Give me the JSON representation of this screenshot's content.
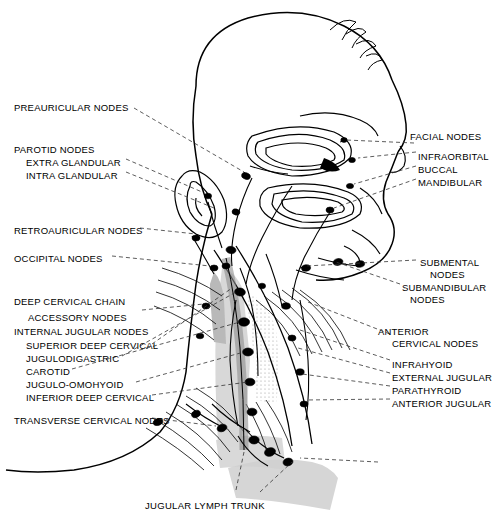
{
  "figure": {
    "title_caption": "JUGULAR LYMPH TRUNK",
    "colors": {
      "ink": "#000000",
      "background": "#ffffff",
      "node_fill": "#000000",
      "vessel_shade": "#c9c9c9",
      "tissue_shade": "#d9d9d9",
      "leader_line": "#555555"
    }
  },
  "labels_left": [
    {
      "id": "preauricular-nodes",
      "text": "PREAURICULAR NODES",
      "x": 14,
      "y": 103,
      "indent": 0
    },
    {
      "id": "parotid-nodes",
      "text": "PAROTID NODES",
      "x": 14,
      "y": 145,
      "indent": 0
    },
    {
      "id": "extra-glandular",
      "text": "EXTRA GLANDULAR",
      "x": 26,
      "y": 158,
      "indent": 12
    },
    {
      "id": "intra-glandular",
      "text": "INTRA GLANDULAR",
      "x": 26,
      "y": 171,
      "indent": 12
    },
    {
      "id": "retroauricular-nodes",
      "text": "RETROAURICULAR NODES",
      "x": 14,
      "y": 226,
      "indent": 0
    },
    {
      "id": "occipital-nodes",
      "text": "OCCIPITAL NODES",
      "x": 14,
      "y": 254,
      "indent": 0
    },
    {
      "id": "deep-cervical-chain",
      "text": "DEEP CERVICAL CHAIN",
      "x": 14,
      "y": 297,
      "indent": 0
    },
    {
      "id": "accessory-nodes",
      "text": "ACCESSORY  NODES",
      "x": 28,
      "y": 313,
      "indent": 14
    },
    {
      "id": "internal-jugular-nodes",
      "text": "INTERNAL JUGULAR NODES",
      "x": 14,
      "y": 327,
      "indent": 0
    },
    {
      "id": "superior-deep-cervical",
      "text": "SUPERIOR DEEP CERVICAL",
      "x": 26,
      "y": 341,
      "indent": 12
    },
    {
      "id": "jugulodigastric",
      "text": "JUGULODIGASTRIC",
      "x": 26,
      "y": 354,
      "indent": 12
    },
    {
      "id": "carotid",
      "text": "CAROTID",
      "x": 26,
      "y": 367,
      "indent": 12
    },
    {
      "id": "jugulo-omohyoid",
      "text": "JUGULO-OMOHYOID",
      "x": 26,
      "y": 380,
      "indent": 12
    },
    {
      "id": "inferior-deep-cervical",
      "text": "INFERIOR DEEP CERVICAL",
      "x": 26,
      "y": 393,
      "indent": 12
    },
    {
      "id": "transverse-cervical-nodes",
      "text": "TRANSVERSE CERVICAL NODES",
      "x": 14,
      "y": 416,
      "indent": 0
    }
  ],
  "labels_right": [
    {
      "id": "facial-nodes",
      "text": "FACIAL NODES",
      "x": 410,
      "y": 132,
      "indent": 0
    },
    {
      "id": "infraorbital",
      "text": "INFRAORBITAL",
      "x": 418,
      "y": 152,
      "indent": 8
    },
    {
      "id": "buccal",
      "text": "BUCCAL",
      "x": 418,
      "y": 165,
      "indent": 8
    },
    {
      "id": "mandibular",
      "text": "MANDIBULAR",
      "x": 418,
      "y": 178,
      "indent": 8
    },
    {
      "id": "submental-nodes",
      "text": "SUBMENTAL",
      "x": 420,
      "y": 258,
      "indent": 0
    },
    {
      "id": "submental-nodes-2",
      "text": "NODES",
      "x": 430,
      "y": 270,
      "indent": 0
    },
    {
      "id": "submandibular-nodes",
      "text": "SUBMANDIBULAR",
      "x": 402,
      "y": 283,
      "indent": 0
    },
    {
      "id": "submandibular-nodes-2",
      "text": "NODES",
      "x": 410,
      "y": 295,
      "indent": 0
    },
    {
      "id": "anterior-cervical-nodes",
      "text": "ANTERIOR",
      "x": 378,
      "y": 327,
      "indent": 0
    },
    {
      "id": "anterior-cervical-nodes-2",
      "text": "CERVICAL NODES",
      "x": 392,
      "y": 339,
      "indent": 0
    },
    {
      "id": "infrahyoid",
      "text": "INFRAHYOID",
      "x": 392,
      "y": 360,
      "indent": 0
    },
    {
      "id": "external-jugular",
      "text": "EXTERNAL JUGULAR",
      "x": 392,
      "y": 373,
      "indent": 0
    },
    {
      "id": "parathyroid",
      "text": "PARATHYROID",
      "x": 392,
      "y": 386,
      "indent": 0
    },
    {
      "id": "anterior-jugular",
      "text": "ANTERIOR JUGULAR",
      "x": 392,
      "y": 399,
      "indent": 0
    }
  ],
  "caption": {
    "text": "JUGULAR LYMPH TRUNK",
    "x": 145,
    "y": 505
  }
}
